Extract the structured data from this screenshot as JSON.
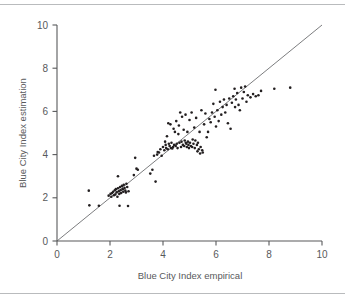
{
  "chart_data": {
    "type": "scatter",
    "title": "",
    "xlabel": "Blue City Index empirical",
    "ylabel": "Blue City Index estimation",
    "xlim": [
      0,
      10
    ],
    "ylim": [
      0,
      10
    ],
    "xticks": [
      0,
      2,
      4,
      6,
      8,
      10
    ],
    "yticks": [
      0,
      2,
      4,
      6,
      8,
      10
    ],
    "xtick_labels": [
      "0",
      "2",
      "4",
      "6",
      "8",
      "10"
    ],
    "ytick_labels": [
      "0",
      "2",
      "4",
      "6",
      "8",
      "10"
    ],
    "grid": false,
    "legend": false,
    "marker_color": "#231f20",
    "marker_size": 2.6,
    "reference_line": {
      "name": "identity",
      "x": [
        0,
        10
      ],
      "y": [
        0,
        10
      ],
      "color": "#6d6e71",
      "width": 0.9
    },
    "axis_color": "#58595b",
    "series": [
      {
        "name": "cities",
        "x": [
          1.2,
          1.22,
          1.58,
          1.95,
          2.02,
          2.05,
          2.08,
          2.12,
          2.15,
          2.18,
          2.2,
          2.22,
          2.25,
          2.28,
          2.3,
          2.33,
          2.35,
          2.38,
          2.4,
          2.42,
          2.45,
          2.48,
          2.5,
          2.52,
          2.55,
          2.58,
          2.6,
          2.62,
          2.65,
          2.68,
          2.3,
          2.36,
          2.7,
          2.9,
          2.95,
          3.0,
          3.05,
          3.52,
          3.6,
          3.66,
          3.72,
          3.78,
          3.8,
          3.85,
          3.9,
          3.95,
          4.0,
          4.05,
          4.08,
          4.1,
          4.12,
          4.15,
          4.18,
          4.2,
          4.22,
          4.25,
          4.28,
          4.3,
          4.32,
          4.35,
          4.38,
          4.4,
          4.42,
          4.45,
          4.48,
          4.5,
          4.52,
          4.55,
          4.58,
          4.6,
          4.62,
          4.65,
          4.68,
          4.7,
          4.72,
          4.75,
          4.78,
          4.8,
          4.82,
          4.85,
          4.86,
          4.88,
          4.9,
          4.92,
          4.94,
          4.96,
          4.98,
          5.0,
          5.02,
          5.05,
          5.08,
          5.1,
          5.12,
          5.15,
          5.18,
          5.2,
          5.22,
          5.25,
          5.28,
          5.3,
          5.32,
          5.35,
          5.38,
          5.4,
          5.42,
          5.45,
          5.48,
          5.5,
          5.55,
          5.6,
          5.65,
          5.7,
          5.75,
          5.8,
          5.85,
          5.9,
          5.95,
          5.98,
          6.0,
          6.05,
          6.1,
          6.15,
          6.2,
          6.25,
          6.3,
          6.35,
          6.4,
          6.45,
          6.5,
          6.55,
          6.6,
          6.65,
          6.7,
          6.72,
          6.75,
          6.8,
          6.85,
          6.9,
          6.95,
          7.0,
          7.05,
          7.1,
          7.15,
          7.2,
          7.3,
          7.4,
          7.5,
          7.6,
          7.7,
          8.2,
          8.8
        ],
        "y": [
          2.33,
          1.65,
          1.63,
          2.1,
          2.18,
          2.05,
          2.22,
          2.28,
          2.12,
          2.35,
          2.15,
          2.4,
          2.25,
          2.05,
          2.44,
          2.3,
          2.18,
          2.5,
          2.35,
          2.22,
          2.55,
          2.4,
          2.28,
          2.6,
          2.45,
          2.33,
          2.25,
          2.65,
          2.5,
          1.62,
          3.0,
          1.63,
          2.3,
          3.05,
          3.85,
          3.35,
          3.3,
          3.12,
          3.3,
          3.95,
          2.75,
          4.0,
          4.12,
          4.1,
          4.25,
          3.95,
          4.35,
          4.2,
          4.6,
          4.45,
          4.3,
          4.85,
          4.25,
          5.45,
          4.5,
          4.4,
          5.4,
          4.3,
          4.55,
          4.28,
          4.35,
          5.2,
          4.45,
          5.05,
          4.4,
          5.55,
          4.5,
          4.3,
          4.95,
          5.35,
          4.55,
          5.95,
          4.35,
          4.6,
          5.75,
          4.45,
          5.15,
          4.4,
          4.65,
          5.85,
          4.55,
          4.5,
          4.35,
          5.05,
          4.6,
          4.45,
          4.3,
          5.6,
          4.55,
          4.4,
          5.95,
          4.35,
          4.7,
          4.5,
          5.25,
          4.3,
          4.65,
          5.7,
          4.45,
          4.15,
          4.55,
          4.25,
          5.05,
          4.05,
          4.35,
          6.05,
          4.2,
          4.1,
          5.4,
          5.9,
          4.8,
          5.05,
          5.65,
          5.5,
          5.95,
          6.35,
          5.75,
          7.0,
          5.3,
          6.05,
          5.55,
          6.45,
          5.85,
          6.2,
          6.55,
          5.95,
          6.3,
          5.45,
          6.6,
          5.2,
          6.4,
          6.7,
          7.05,
          6.2,
          6.55,
          6.85,
          6.3,
          6.05,
          7.1,
          6.6,
          6.9,
          7.15,
          6.45,
          6.75,
          6.65,
          6.8,
          6.7,
          6.75,
          6.95,
          7.05,
          7.1
        ]
      }
    ]
  }
}
